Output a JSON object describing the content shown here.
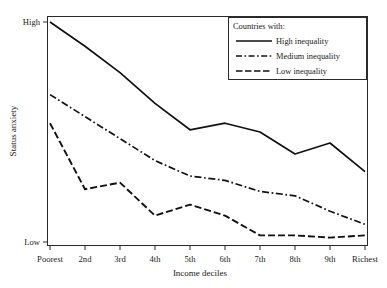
{
  "chart_data": {
    "type": "line",
    "title": "",
    "xlabel": "Income  deciles",
    "ylabel": "Status anxiety",
    "categories": [
      "Poorest",
      "2nd",
      "3rd",
      "4th",
      "5th",
      "6th",
      "7th",
      "8th",
      "9th",
      "Richest"
    ],
    "ytick_labels": [
      "High",
      "Low"
    ],
    "ylim": [
      0,
      100
    ],
    "yticks": [
      100,
      0
    ],
    "grid": false,
    "legend_position": "top-right",
    "legend_title": "Countries with:",
    "series": [
      {
        "name": "High inequality",
        "style": "solid",
        "color": "#111111",
        "values": [
          100,
          89,
          77,
          63,
          51,
          54,
          50,
          40,
          45,
          32
        ]
      },
      {
        "name": "Medium inequality",
        "style": "dash-dot",
        "color": "#111111",
        "values": [
          67,
          57,
          47,
          37,
          30,
          28,
          23,
          21,
          14,
          8
        ]
      },
      {
        "name": "Low inequality",
        "style": "dashed",
        "color": "#111111",
        "values": [
          54,
          24,
          27,
          12,
          17,
          12,
          3,
          3,
          2,
          3
        ]
      }
    ]
  },
  "figure": {
    "axis": {
      "y_label": "Status anxiety",
      "y_high_label": "High",
      "y_low_label": "Low",
      "x_label": "Income  deciles"
    },
    "legend": {
      "title": "Countries with:",
      "entries": [
        {
          "label": "High inequality",
          "style": "solid"
        },
        {
          "label": "Medium inequality",
          "style": "dash-dot"
        },
        {
          "label": "Low inequality",
          "style": "dashed"
        }
      ]
    }
  }
}
